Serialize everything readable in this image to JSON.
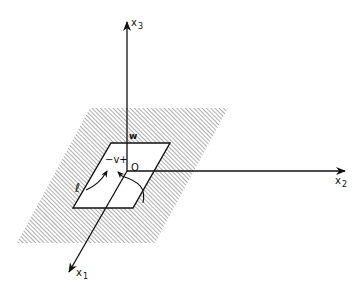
{
  "diagram": {
    "type": "3d-coordinate-axes-with-plane",
    "axes": {
      "x1": {
        "base": "x",
        "sub": "1"
      },
      "x2": {
        "base": "x",
        "sub": "2"
      },
      "x3": {
        "base": "x",
        "sub": "3"
      }
    },
    "labels": {
      "origin": "O",
      "w": "w",
      "v": "−v+",
      "ell": "ℓ"
    },
    "colors": {
      "ink": "#111111",
      "background": "#ffffff",
      "hatch": "#555555"
    }
  }
}
